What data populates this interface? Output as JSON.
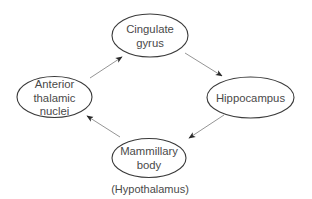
{
  "diagram": {
    "type": "cycle",
    "title": "",
    "colors": {
      "node_stroke": "#3a3a3a",
      "node_fill": "#ffffff",
      "text": "#4a4a4a",
      "edge": "#7a7a7a",
      "arrowhead": "#2a2a2a"
    },
    "nodes": [
      {
        "id": "cingulate",
        "label_lines": [
          "Cingulate",
          "gyrus"
        ],
        "shape": "ellipse"
      },
      {
        "id": "hippocampus",
        "label_lines": [
          "Hippocampus"
        ],
        "shape": "ellipse"
      },
      {
        "id": "mammillary",
        "label_lines": [
          "Mammillary",
          "body"
        ],
        "shape": "ellipse",
        "sublabel": "(Hypothalamus)"
      },
      {
        "id": "anterior",
        "label_lines": [
          "Anterior",
          "thalamic",
          "nuclei"
        ],
        "shape": "ellipse"
      }
    ],
    "edges": [
      {
        "from": "cingulate",
        "to": "hippocampus"
      },
      {
        "from": "hippocampus",
        "to": "mammillary"
      },
      {
        "from": "mammillary",
        "to": "anterior"
      },
      {
        "from": "anterior",
        "to": "cingulate"
      }
    ]
  }
}
